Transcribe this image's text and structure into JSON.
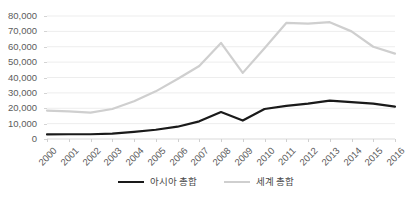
{
  "chart_data": {
    "type": "line",
    "title": "",
    "xlabel": "",
    "ylabel": "",
    "grid": true,
    "legend_position": "bottom",
    "ylim": [
      0,
      80000
    ],
    "ytick_labels": [
      "80,000",
      "70,000",
      "60,000",
      "50,000",
      "40,000",
      "30,000",
      "20,000",
      "10,000",
      "0"
    ],
    "ytick_values": [
      80000,
      70000,
      60000,
      50000,
      40000,
      30000,
      20000,
      10000,
      0
    ],
    "categories": [
      "2000",
      "2001",
      "2002",
      "2003",
      "2004",
      "2005",
      "2006",
      "2007",
      "2008",
      "2009",
      "2010",
      "2011",
      "2012",
      "2013",
      "2014",
      "2015",
      "2016"
    ],
    "series": [
      {
        "name": "아시아 총합",
        "color": "#1a1a1a",
        "width": 2.2,
        "values": [
          3000,
          3100,
          3100,
          3500,
          4600,
          6000,
          8000,
          11500,
          17500,
          12000,
          19500,
          21500,
          23000,
          25000,
          24000,
          23000,
          21000
        ]
      },
      {
        "name": "세계 총합",
        "color": "#cfcfcf",
        "width": 2.2,
        "values": [
          18500,
          18000,
          17200,
          19500,
          24500,
          31000,
          39000,
          47500,
          62500,
          43000,
          59000,
          75500,
          75000,
          76000,
          70000,
          60000,
          55500
        ]
      }
    ]
  },
  "legend": {
    "items": [
      {
        "label": "아시아 총합",
        "color": "#1a1a1a"
      },
      {
        "label": "세계 총합",
        "color": "#cfcfcf"
      }
    ]
  }
}
